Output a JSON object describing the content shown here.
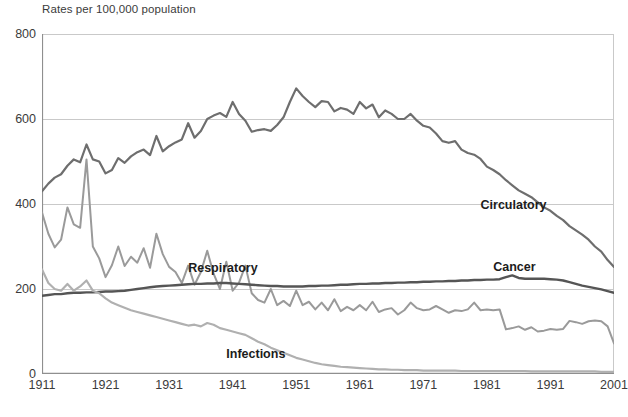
{
  "chart_data": {
    "type": "line",
    "title": "Rates per 100,000 population",
    "subtitle": "",
    "xlabel": "",
    "ylabel": "Rates per 100,000 population",
    "xlim": [
      1911,
      2001
    ],
    "ylim": [
      0,
      800
    ],
    "ytick_labels": [
      "0",
      "200",
      "400",
      "600",
      "800"
    ],
    "yticks": [
      0,
      200,
      400,
      600,
      800
    ],
    "xtick_labels": [
      "1911",
      "1921",
      "1931",
      "1941",
      "1951",
      "1961",
      "1971",
      "1981",
      "1991",
      "2001"
    ],
    "xticks": [
      1911,
      1921,
      1931,
      1941,
      1951,
      1961,
      1971,
      1981,
      1991,
      2001
    ],
    "grid": "horizontal",
    "legend_position": "inline-annotations",
    "x": [
      1911,
      1912,
      1913,
      1914,
      1915,
      1916,
      1917,
      1918,
      1919,
      1920,
      1921,
      1922,
      1923,
      1924,
      1925,
      1926,
      1927,
      1928,
      1929,
      1930,
      1931,
      1932,
      1933,
      1934,
      1935,
      1936,
      1937,
      1938,
      1939,
      1940,
      1941,
      1942,
      1943,
      1944,
      1945,
      1946,
      1947,
      1948,
      1949,
      1950,
      1951,
      1952,
      1953,
      1954,
      1955,
      1956,
      1957,
      1958,
      1959,
      1960,
      1961,
      1962,
      1963,
      1964,
      1965,
      1966,
      1967,
      1968,
      1969,
      1970,
      1971,
      1972,
      1973,
      1974,
      1975,
      1976,
      1977,
      1978,
      1979,
      1980,
      1981,
      1982,
      1983,
      1984,
      1985,
      1986,
      1987,
      1988,
      1989,
      1990,
      1991,
      1992,
      1993,
      1994,
      1995,
      1996,
      1997,
      1998,
      1999,
      2000,
      2001
    ],
    "series": [
      {
        "name": "Circulatory",
        "color": "#6e6e6e",
        "width": 2.2,
        "label_x": 1980,
        "label_y": 395,
        "values": [
          430,
          448,
          462,
          470,
          490,
          505,
          498,
          540,
          505,
          500,
          472,
          480,
          508,
          497,
          512,
          522,
          528,
          515,
          560,
          524,
          536,
          545,
          552,
          590,
          556,
          572,
          600,
          608,
          614,
          605,
          640,
          612,
          596,
          570,
          574,
          576,
          572,
          586,
          604,
          640,
          672,
          654,
          640,
          628,
          642,
          640,
          618,
          626,
          622,
          612,
          640,
          625,
          634,
          604,
          620,
          612,
          600,
          600,
          612,
          596,
          584,
          580,
          566,
          548,
          544,
          548,
          528,
          520,
          516,
          506,
          488,
          480,
          470,
          456,
          444,
          432,
          424,
          416,
          404,
          392,
          384,
          372,
          362,
          348,
          338,
          328,
          316,
          300,
          288,
          268,
          252
        ]
      },
      {
        "name": "Respiratory",
        "color": "#9a9a9a",
        "width": 2.0,
        "label_x": 1934,
        "label_y": 248,
        "values": [
          380,
          330,
          298,
          316,
          392,
          352,
          344,
          505,
          300,
          272,
          228,
          256,
          300,
          254,
          276,
          262,
          296,
          250,
          330,
          282,
          252,
          240,
          214,
          255,
          210,
          240,
          290,
          236,
          200,
          264,
          196,
          215,
          255,
          190,
          174,
          168,
          200,
          162,
          172,
          160,
          196,
          162,
          170,
          152,
          168,
          150,
          176,
          148,
          158,
          150,
          162,
          150,
          170,
          146,
          152,
          155,
          140,
          150,
          168,
          155,
          150,
          152,
          160,
          152,
          144,
          150,
          148,
          152,
          168,
          150,
          152,
          150,
          152,
          105,
          108,
          112,
          104,
          110,
          100,
          102,
          106,
          104,
          106,
          125,
          122,
          118,
          124,
          126,
          124,
          112,
          72
        ]
      },
      {
        "name": "Cancer",
        "color": "#555555",
        "width": 2.4,
        "label_x": 1982,
        "label_y": 250,
        "values": [
          184,
          186,
          188,
          188,
          190,
          191,
          191,
          192,
          192,
          193,
          194,
          194,
          195,
          196,
          198,
          200,
          202,
          204,
          206,
          207,
          208,
          209,
          210,
          211,
          212,
          212,
          213,
          213,
          214,
          214,
          213,
          212,
          211,
          210,
          209,
          208,
          207,
          207,
          206,
          206,
          206,
          206,
          207,
          207,
          208,
          208,
          209,
          210,
          210,
          211,
          212,
          212,
          213,
          213,
          214,
          214,
          215,
          215,
          216,
          216,
          217,
          217,
          218,
          218,
          219,
          219,
          220,
          220,
          221,
          221,
          222,
          222,
          223,
          228,
          232,
          226,
          224,
          224,
          224,
          224,
          223,
          222,
          220,
          216,
          212,
          208,
          205,
          202,
          199,
          195,
          191
        ]
      },
      {
        "name": "Infections",
        "color": "#b0b0b0",
        "width": 2.2,
        "label_x": 1940,
        "label_y": 44,
        "values": [
          246,
          214,
          200,
          196,
          212,
          196,
          206,
          220,
          196,
          190,
          178,
          168,
          162,
          156,
          150,
          146,
          142,
          138,
          134,
          130,
          126,
          122,
          118,
          114,
          116,
          112,
          120,
          116,
          108,
          104,
          100,
          96,
          92,
          84,
          76,
          70,
          62,
          56,
          50,
          44,
          38,
          34,
          30,
          26,
          23,
          21,
          19,
          17,
          16,
          15,
          14,
          13,
          12,
          11,
          11,
          10,
          10,
          9,
          9,
          9,
          8,
          8,
          8,
          8,
          8,
          8,
          7,
          7,
          7,
          7,
          7,
          7,
          7,
          7,
          7,
          7,
          7,
          6,
          6,
          6,
          6,
          6,
          6,
          6,
          6,
          6,
          6,
          6,
          5,
          5,
          5
        ]
      }
    ]
  }
}
